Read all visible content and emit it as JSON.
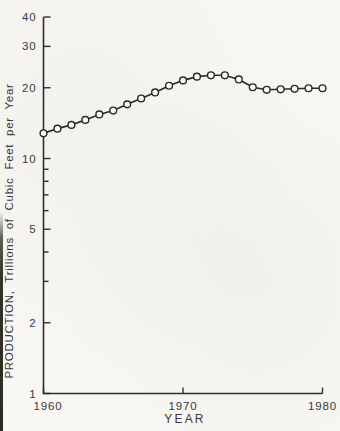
{
  "figure": {
    "paper_color": "#f8f7f4",
    "ink_color": "#2f2e2c",
    "label_color": "#3a3937"
  },
  "chart_data": {
    "type": "line",
    "title": "",
    "xlabel": "YEAR",
    "ylabel": "PRODUCTION, Trillions of Cubic Feet per Year",
    "x": [
      1960,
      1961,
      1962,
      1963,
      1964,
      1965,
      1966,
      1967,
      1968,
      1969,
      1970,
      1971,
      1972,
      1973,
      1974,
      1975,
      1976,
      1977,
      1978,
      1979,
      1980
    ],
    "y": [
      12.8,
      13.4,
      13.9,
      14.6,
      15.4,
      16.0,
      17.0,
      18.0,
      19.1,
      20.4,
      21.5,
      22.3,
      22.6,
      22.6,
      21.7,
      20.1,
      19.6,
      19.7,
      19.8,
      19.9,
      19.9
    ],
    "x_scale": "linear",
    "y_scale": "log",
    "xlim": [
      1960,
      1980
    ],
    "ylim": [
      1,
      40
    ],
    "x_ticks": [
      1960,
      1970,
      1980
    ],
    "x_tick_labels": [
      "1960",
      "1970",
      "1980"
    ],
    "y_major_ticks": [
      1,
      2,
      5,
      10,
      20,
      30,
      40
    ],
    "y_major_tick_labels": [
      "1",
      "2",
      "5",
      "10",
      "20",
      "30",
      "40"
    ],
    "y_minor_ticks": [
      3,
      4,
      6,
      7,
      8,
      9
    ],
    "grid": false,
    "legend": "none",
    "marker": "open-circle"
  }
}
